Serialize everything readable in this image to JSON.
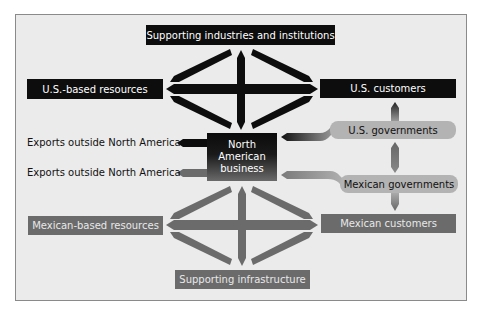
{
  "diagram": {
    "top_box": "Supporting industries and institutions",
    "us_resources": "U.S.-based resources",
    "us_customers": "U.S. customers",
    "us_governments": "U.S. governments",
    "center": [
      "North",
      "American",
      "business"
    ],
    "exports_1": "Exports outside North America",
    "exports_2": "Exports outside North America",
    "mexican_governments": "Mexican governments",
    "mexican_resources": "Mexican-based resources",
    "mexican_customers": "Mexican customers",
    "bottom_box": "Supporting infrastructure"
  },
  "colors": {
    "frame_bg": "#ebebeb",
    "dark": "#0d0d0d",
    "gray": "#6b6b6b",
    "pill": "#b3b3b3"
  }
}
